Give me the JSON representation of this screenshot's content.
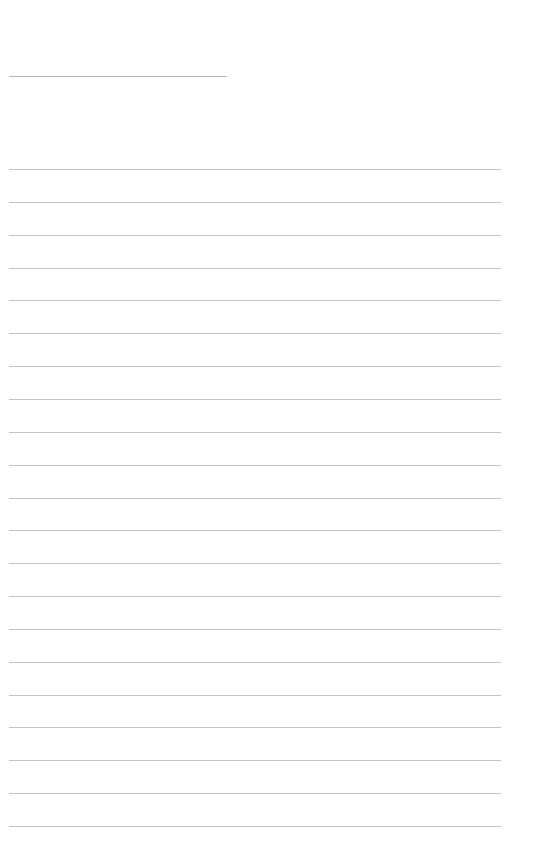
{
  "page": {
    "type": "blank lined sheet",
    "background": "#ffffff",
    "line_color": "#c4c4c4",
    "title_line": {
      "present": true,
      "text": ""
    },
    "ruled_lines": {
      "count": 21,
      "first_y": 169,
      "spacing": 32.85,
      "entries": [
        "",
        "",
        "",
        "",
        "",
        "",
        "",
        "",
        "",
        "",
        "",
        "",
        "",
        "",
        "",
        "",
        "",
        "",
        "",
        "",
        ""
      ]
    }
  }
}
